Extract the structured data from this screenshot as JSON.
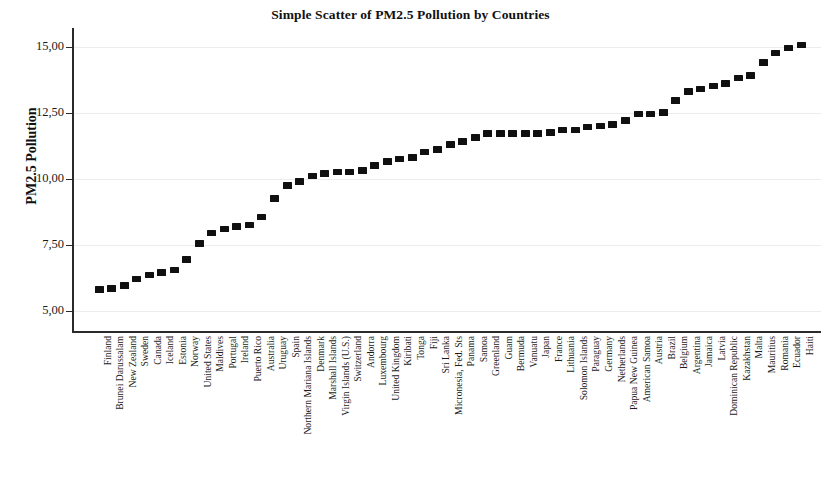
{
  "chart_data": {
    "type": "scatter",
    "title": "Simple Scatter of PM2.5 Pollution by Countries",
    "xlabel": "",
    "ylabel": "PM2.5 Pollution",
    "ylim": [
      4.2,
      15.7
    ],
    "ytick_labels": [
      "5,00",
      "7,50",
      "10,00",
      "12,50",
      "15,00"
    ],
    "ytick_values": [
      5.0,
      7.5,
      10.0,
      12.5,
      15.0
    ],
    "grid": true,
    "legend": null,
    "marker_style": "filled-square",
    "marker_color": "#101010",
    "categories": [
      "Finland",
      "Brunei Darussalam",
      "New Zealand",
      "Sweden",
      "Canada",
      "Iceland",
      "Estonia",
      "Norway",
      "United States",
      "Maldives",
      "Portugal",
      "Ireland",
      "Puerto Rico",
      "Australia",
      "Uruguay",
      "Spain",
      "Northern Mariana Islands",
      "Denmark",
      "Marshall Islands",
      "Virgin Islands (U.S.)",
      "Switzerland",
      "Andorra",
      "Luxembourg",
      "United Kingdom",
      "Kiribati",
      "Tonga",
      "Fiji",
      "Sri Lanka",
      "Micronesia, Fed. Sts",
      "Panama",
      "Samoa",
      "Greenland",
      "Guam",
      "Bermuda",
      "Vanuatu",
      "Japan",
      "France",
      "Lithuania",
      "Solomon Islands",
      "Paraguay",
      "Germany",
      "Netherlands",
      "Papua New Guinea",
      "American Samoa",
      "Austria",
      "Brazil",
      "Belgium",
      "Argentina",
      "Jamaica",
      "Latvia",
      "Dominican Republic",
      "Kazakhstan",
      "Malta",
      "Mauritius",
      "Romania",
      "Ecuador",
      "Haiti"
    ],
    "values": [
      5.8,
      5.85,
      5.95,
      6.2,
      6.35,
      6.45,
      6.55,
      6.95,
      7.55,
      7.95,
      8.1,
      8.2,
      8.25,
      8.55,
      9.25,
      9.75,
      9.9,
      10.1,
      10.2,
      10.25,
      10.25,
      10.3,
      10.5,
      10.65,
      10.75,
      10.8,
      11.0,
      11.1,
      11.3,
      11.4,
      11.55,
      11.7,
      11.7,
      11.7,
      11.7,
      11.7,
      11.75,
      11.85,
      11.85,
      11.95,
      12.0,
      12.05,
      12.2,
      12.45,
      12.45,
      12.5,
      12.95,
      13.3,
      13.4,
      13.5,
      13.6,
      13.8,
      13.9,
      14.4,
      14.75,
      14.95,
      15.05
    ]
  }
}
